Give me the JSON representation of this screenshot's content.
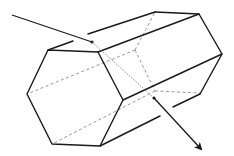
{
  "diagram": {
    "colors": {
      "line": "#1a1a1a",
      "hidden_line": "#8a8a8a",
      "background": "#ffffff"
    },
    "front_hexagon": [
      [
        48,
        50
      ],
      [
        98,
        52
      ],
      [
        123,
        100
      ],
      [
        100,
        146
      ],
      [
        52,
        144
      ],
      [
        27,
        94
      ]
    ],
    "back_visible_edges": [
      [
        [
          155,
          12
        ],
        [
          199,
          14
        ]
      ],
      [
        [
          199,
          14
        ],
        [
          222,
          54
        ]
      ],
      [
        [
          222,
          54
        ],
        [
          200,
          94
        ]
      ]
    ],
    "lateral_edges": [
      [
        [
          88,
          34
        ],
        [
          155,
          12
        ]
      ],
      [
        [
          48,
          50
        ],
        [
          73,
          41
        ]
      ],
      [
        [
          98,
          52
        ],
        [
          199,
          14
        ]
      ],
      [
        [
          123,
          100
        ],
        [
          222,
          54
        ]
      ],
      [
        [
          100,
          146
        ],
        [
          160,
          116
        ]
      ],
      [
        [
          173,
          107
        ],
        [
          200,
          94
        ]
      ]
    ],
    "hidden_edges": [
      [
        [
          135,
          50
        ],
        [
          155,
          12
        ]
      ],
      [
        [
          135,
          50
        ],
        [
          27,
          94
        ]
      ],
      [
        [
          135,
          50
        ],
        [
          155,
          91
        ]
      ],
      [
        [
          155,
          91
        ],
        [
          52,
          144
        ]
      ],
      [
        [
          155,
          91
        ],
        [
          200,
          93
        ]
      ]
    ],
    "incident_ray": {
      "from": [
        12,
        15
      ],
      "to": [
        92,
        42
      ]
    },
    "internal_path": {
      "from": [
        92,
        42
      ],
      "to": [
        154,
        98
      ]
    },
    "exit_ray": {
      "from": [
        154,
        98
      ],
      "to": [
        202,
        150
      ]
    }
  }
}
